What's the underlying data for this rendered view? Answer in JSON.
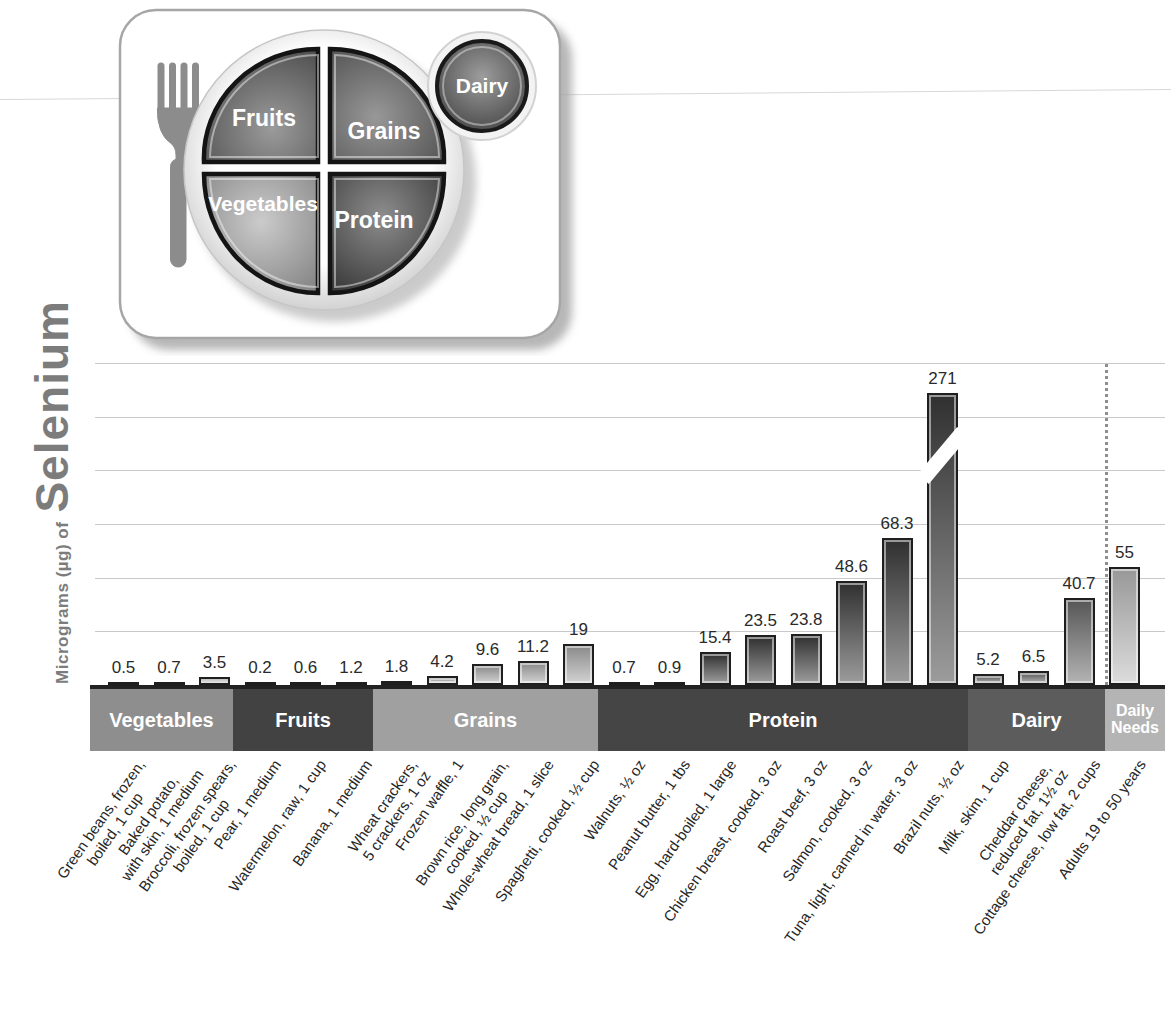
{
  "y_axis": {
    "unit_label": "Micrograms (µg) of",
    "nutrient": "Selenium"
  },
  "plate": {
    "fruits_label": "Fruits",
    "grains_label": "Grains",
    "vegetables_label": "Vegetables",
    "protein_label": "Protein",
    "dairy_label": "Dairy"
  },
  "chart_data": {
    "type": "bar",
    "ylabel": "Micrograms (µg) of Selenium",
    "unit": "µg",
    "ylim": [
      0,
      150
    ],
    "gridline_step": 25,
    "grid_on": true,
    "axis_break": {
      "bar": "Brazil nuts, ½ oz",
      "value": 271,
      "note": "bar drawn with break slash, exceeds axis max"
    },
    "daily_needs_separator": "dotted vertical line",
    "groups": [
      {
        "label": "Vegetables",
        "band_color": "#8e8e8e",
        "bar_top_color": "#7e7e7e",
        "bar_bottom_color": "#cfcfcf",
        "bars": [
          {
            "lines": [
              "Green beans, frozen,",
              "boiled, 1 cup"
            ],
            "value": 0.5,
            "display": "0.5"
          },
          {
            "lines": [
              "Baked potato,",
              "with skin, 1 medium"
            ],
            "value": 0.7,
            "display": "0.7"
          },
          {
            "lines": [
              "Broccoli, frozen spears,",
              "boiled, 1 cup"
            ],
            "value": 3.5,
            "display": "3.5"
          }
        ]
      },
      {
        "label": "Fruits",
        "band_color": "#424242",
        "bar_top_color": "#2f2f2f",
        "bar_bottom_color": "#8a8a8a",
        "bars": [
          {
            "lines": [
              "Pear, 1 medium"
            ],
            "value": 0.2,
            "display": "0.2"
          },
          {
            "lines": [
              "Watermelon, raw, 1 cup"
            ],
            "value": 0.6,
            "display": "0.6"
          },
          {
            "lines": [
              "Banana, 1 medium"
            ],
            "value": 1.2,
            "display": "1.2"
          }
        ]
      },
      {
        "label": "Grains",
        "band_color": "#a0a0a0",
        "bar_top_color": "#8a8a8a",
        "bar_bottom_color": "#d2d2d2",
        "bars": [
          {
            "lines": [
              "Wheat crackers,",
              "5 crackers, 1 oz"
            ],
            "value": 1.8,
            "display": "1.8"
          },
          {
            "lines": [
              "Frozen waffle, 1"
            ],
            "value": 4.2,
            "display": "4.2"
          },
          {
            "lines": [
              "Brown rice, long grain,",
              "cooked, ½ cup"
            ],
            "value": 9.6,
            "display": "9.6"
          },
          {
            "lines": [
              "Whole-wheat bread, 1 slice"
            ],
            "value": 11.2,
            "display": "11.2"
          },
          {
            "lines": [
              "Spaghetti, cooked, ½ cup"
            ],
            "value": 19,
            "display": "19"
          }
        ]
      },
      {
        "label": "Protein",
        "band_color": "#454545",
        "bar_top_color": "#303030",
        "bar_bottom_color": "#9c9c9c",
        "bars": [
          {
            "lines": [
              "Walnuts, ½ oz"
            ],
            "value": 0.7,
            "display": "0.7"
          },
          {
            "lines": [
              "Peanut butter, 1 tbs"
            ],
            "value": 0.9,
            "display": "0.9"
          },
          {
            "lines": [
              "Egg, hard-boiled, 1 large"
            ],
            "value": 15.4,
            "display": "15.4"
          },
          {
            "lines": [
              "Chicken breast, cooked, 3 oz"
            ],
            "value": 23.5,
            "display": "23.5"
          },
          {
            "lines": [
              "Roast beef, 3 oz"
            ],
            "value": 23.8,
            "display": "23.8"
          },
          {
            "lines": [
              "Salmon, cooked, 3 oz"
            ],
            "value": 48.6,
            "display": "48.6"
          },
          {
            "lines": [
              "Tuna, light, canned in water, 3 oz"
            ],
            "value": 68.3,
            "display": "68.3"
          },
          {
            "lines": [
              "Brazil nuts, ½ oz"
            ],
            "value": 271,
            "display": "271",
            "broken": true
          }
        ]
      },
      {
        "label": "Dairy",
        "band_color": "#5c5c5c",
        "bar_top_color": "#565656",
        "bar_bottom_color": "#b3b3b3",
        "bars": [
          {
            "lines": [
              "Milk, skim, 1 cup"
            ],
            "value": 5.2,
            "display": "5.2"
          },
          {
            "lines": [
              "Cheddar cheese,",
              "reduced fat, 1½ oz"
            ],
            "value": 6.5,
            "display": "6.5"
          },
          {
            "lines": [
              "Cottage cheese, low fat, 2 cups"
            ],
            "value": 40.7,
            "display": "40.7"
          }
        ]
      },
      {
        "label": "Daily Needs",
        "band_color": "#b4b4b4",
        "bar_top_color": "#989898",
        "bar_bottom_color": "#dcdcdc",
        "separated": true,
        "bars": [
          {
            "lines": [
              "Adults 19 to 50 years"
            ],
            "value": 55,
            "display": "55"
          }
        ]
      }
    ]
  }
}
